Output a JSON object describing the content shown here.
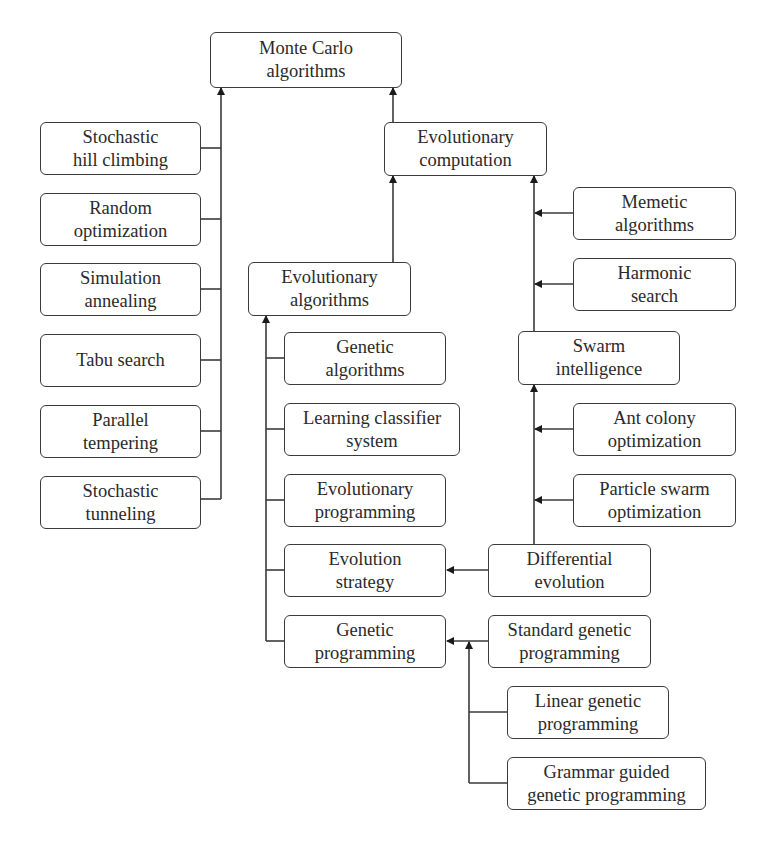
{
  "diagram": {
    "type": "taxonomy-tree",
    "nodes": {
      "monte_carlo": {
        "line1": "Monte Carlo",
        "line2": "algorithms"
      },
      "stochastic_hill": {
        "line1": "Stochastic",
        "line2": "hill climbing"
      },
      "random_opt": {
        "line1": "Random",
        "line2": "optimization"
      },
      "simulation_annealing": {
        "line1": "Simulation",
        "line2": "annealing"
      },
      "tabu_search": {
        "line1": "Tabu search",
        "line2": ""
      },
      "parallel_tempering": {
        "line1": "Parallel",
        "line2": "tempering"
      },
      "stochastic_tunneling": {
        "line1": "Stochastic",
        "line2": "tunneling"
      },
      "evolutionary_computation": {
        "line1": "Evolutionary",
        "line2": "computation"
      },
      "memetic": {
        "line1": "Memetic",
        "line2": "algorithms"
      },
      "harmonic": {
        "line1": "Harmonic",
        "line2": "search"
      },
      "swarm": {
        "line1": "Swarm",
        "line2": "intelligence"
      },
      "ant_colony": {
        "line1": "Ant colony",
        "line2": "optimization"
      },
      "particle_swarm": {
        "line1": "Particle swarm",
        "line2": "optimization"
      },
      "differential_evolution": {
        "line1": "Differential",
        "line2": "evolution"
      },
      "evolutionary_algorithms": {
        "line1": "Evolutionary",
        "line2": "algorithms"
      },
      "genetic_algorithms": {
        "line1": "Genetic",
        "line2": "algorithms"
      },
      "learning_classifier": {
        "line1": "Learning classifier",
        "line2": "system"
      },
      "evolutionary_programming": {
        "line1": "Evolutionary",
        "line2": "programming"
      },
      "evolution_strategy": {
        "line1": "Evolution",
        "line2": "strategy"
      },
      "genetic_programming": {
        "line1": "Genetic",
        "line2": "programming"
      },
      "standard_gp": {
        "line1": "Standard genetic",
        "line2": "programming"
      },
      "linear_gp": {
        "line1": "Linear genetic",
        "line2": "programming"
      },
      "grammar_gp": {
        "line1": "Grammar guided",
        "line2": "genetic programming"
      }
    },
    "edges": [
      [
        "Stochastic hill climbing",
        "Monte Carlo algorithms"
      ],
      [
        "Random optimization",
        "Monte Carlo algorithms"
      ],
      [
        "Simulation annealing",
        "Monte Carlo algorithms"
      ],
      [
        "Tabu search",
        "Monte Carlo algorithms"
      ],
      [
        "Parallel tempering",
        "Monte Carlo algorithms"
      ],
      [
        "Stochastic tunneling",
        "Monte Carlo algorithms"
      ],
      [
        "Evolutionary computation",
        "Monte Carlo algorithms"
      ],
      [
        "Evolutionary algorithms",
        "Evolutionary computation"
      ],
      [
        "Swarm intelligence",
        "Evolutionary computation"
      ],
      [
        "Memetic algorithms",
        "Evolutionary computation"
      ],
      [
        "Harmonic search",
        "Evolutionary computation"
      ],
      [
        "Ant colony optimization",
        "Swarm intelligence"
      ],
      [
        "Particle swarm optimization",
        "Swarm intelligence"
      ],
      [
        "Differential evolution",
        "Swarm intelligence"
      ],
      [
        "Differential evolution",
        "Evolution strategy"
      ],
      [
        "Genetic algorithms",
        "Evolutionary algorithms"
      ],
      [
        "Learning classifier system",
        "Evolutionary algorithms"
      ],
      [
        "Evolutionary programming",
        "Evolutionary algorithms"
      ],
      [
        "Evolution strategy",
        "Evolutionary algorithms"
      ],
      [
        "Genetic programming",
        "Evolutionary algorithms"
      ],
      [
        "Standard genetic programming",
        "Genetic programming"
      ],
      [
        "Linear genetic programming",
        "Genetic programming"
      ],
      [
        "Grammar guided genetic programming",
        "Genetic programming"
      ]
    ],
    "colors": {
      "stroke": "#3a3a3a",
      "text": "#2a2a2a",
      "background": "#ffffff"
    }
  }
}
